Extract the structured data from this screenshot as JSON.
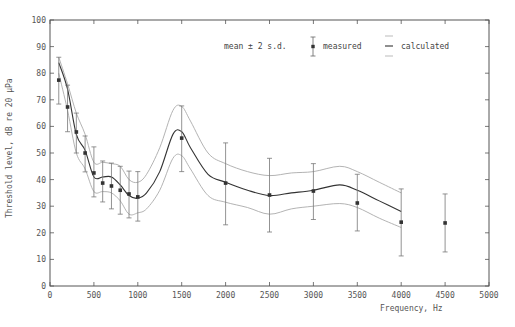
{
  "chart_data": {
    "type": "line",
    "title": "",
    "xlabel": "Frequency,  Hz",
    "ylabel": "Threshold level,  dB re 20 μPa",
    "xlim": [
      0,
      5000
    ],
    "ylim": [
      0,
      100
    ],
    "x_ticks": [
      0,
      500,
      1000,
      1500,
      2000,
      2500,
      3000,
      3500,
      4000,
      4500,
      5000
    ],
    "y_ticks": [
      0,
      10,
      20,
      30,
      40,
      50,
      60,
      70,
      80,
      90,
      100
    ],
    "grid": false,
    "legend": {
      "position": "top-right",
      "prefix": "mean ± 2 s.d.",
      "entries": [
        "measured",
        "calculated"
      ]
    },
    "series": [
      {
        "name": "measured",
        "style": "points-with-errorbars",
        "x": [
          100,
          200,
          300,
          400,
          500,
          600,
          700,
          800,
          900,
          1000,
          1500,
          2000,
          2500,
          3000,
          3500,
          4000,
          4500
        ],
        "mean": [
          77.4,
          67.3,
          57.9,
          50.0,
          42.5,
          38.7,
          37.6,
          36.0,
          34.6,
          33.5,
          55.6,
          38.7,
          34.2,
          35.7,
          31.2,
          24.0,
          23.7
        ],
        "upper": [
          86.0,
          75.5,
          65.0,
          56.4,
          52.3,
          47.0,
          46.2,
          45.0,
          43.2,
          43.0,
          67.7,
          53.8,
          48.0,
          46.0,
          42.0,
          36.5,
          34.6
        ],
        "lower": [
          68.4,
          58.0,
          50.0,
          42.9,
          33.5,
          31.6,
          29.0,
          27.0,
          25.6,
          24.4,
          43.0,
          23.0,
          20.3,
          25.0,
          20.7,
          11.3,
          12.8
        ]
      },
      {
        "name": "calculated",
        "style": "line-with-band",
        "x": [
          100,
          200,
          300,
          400,
          500,
          600,
          700,
          800,
          900,
          1000,
          1100,
          1250,
          1400,
          1500,
          1600,
          1800,
          2000,
          2250,
          2500,
          2750,
          3000,
          3300,
          3500,
          3750,
          4000
        ],
        "mean": [
          84.0,
          74.0,
          57.0,
          51.0,
          41.0,
          41.0,
          41.0,
          38.0,
          34.0,
          33.0,
          35.0,
          43.0,
          57.0,
          58.0,
          52.0,
          42.0,
          39.0,
          36.0,
          34.0,
          35.0,
          36.0,
          38.0,
          36.0,
          32.0,
          28.0
        ],
        "upper": [
          86.0,
          76.0,
          65.0,
          57.0,
          46.5,
          46.5,
          46.0,
          45.0,
          40.0,
          39.0,
          42.0,
          52.0,
          66.0,
          67.5,
          62.0,
          50.0,
          46.0,
          43.0,
          41.5,
          42.5,
          43.0,
          45.0,
          43.0,
          39.0,
          35.0
        ],
        "lower": [
          80.0,
          66.0,
          50.0,
          44.0,
          35.5,
          35.5,
          35.0,
          32.0,
          27.0,
          27.5,
          29.0,
          36.0,
          48.0,
          49.0,
          44.0,
          34.0,
          31.5,
          29.5,
          27.0,
          29.0,
          30.0,
          31.0,
          29.5,
          25.5,
          22.0
        ]
      }
    ]
  }
}
